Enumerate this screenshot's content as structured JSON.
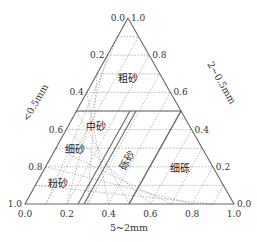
{
  "diagram": {
    "type": "ternary",
    "geometry": {
      "apex": [
        128,
        18
      ],
      "bottom_left": [
        25,
        204
      ],
      "bottom_right": [
        234,
        204
      ]
    },
    "axes": {
      "left": {
        "title": "<0.5mm",
        "ticks": [
          "0.0",
          "0.2",
          "0.4",
          "0.6",
          "0.8",
          "1.0"
        ]
      },
      "right": {
        "title": "2~0.5mm",
        "ticks": [
          "1.0",
          "0.8",
          "0.6",
          "0.4",
          "0.2",
          "0.0"
        ]
      },
      "bottom": {
        "title": "5~2mm",
        "ticks": [
          "0.0",
          "0.2",
          "0.4",
          "0.6",
          "0.8",
          "1.0"
        ]
      }
    },
    "regions": [
      {
        "name": "粗砂",
        "pos": [
          128,
          82
        ]
      },
      {
        "name": "中砂",
        "pos": [
          96,
          130
        ]
      },
      {
        "name": "细砂",
        "pos": [
          75,
          153
        ]
      },
      {
        "name": "粉砂",
        "pos": [
          58,
          187
        ]
      },
      {
        "name": "砾砂",
        "pos": [
          130,
          162
        ],
        "rotate": -60
      },
      {
        "name": "细砾",
        "pos": [
          180,
          172
        ]
      }
    ],
    "colors": {
      "line": "#666666",
      "grid": "#999999",
      "text": "#333333"
    }
  }
}
